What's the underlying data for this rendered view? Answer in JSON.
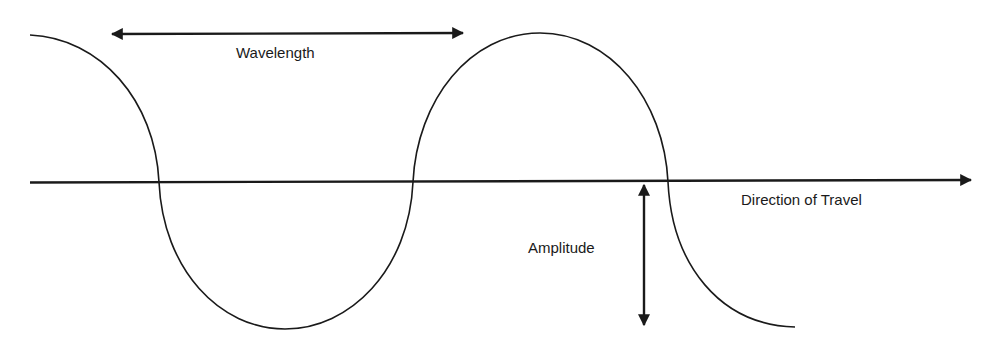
{
  "diagram": {
    "colors": {
      "stroke": "#1a1a1a",
      "background": "#ffffff"
    },
    "labels": {
      "wavelength": "Wavelength",
      "direction": "Direction of Travel",
      "amplitude": "Amplitude"
    },
    "elements": [
      {
        "id": "wave-curve",
        "type": "sine-curve",
        "start": [
          30,
          35
        ],
        "end": [
          795,
          327
        ],
        "crests_x": [
          30,
          540
        ],
        "troughs_x": [
          285,
          795
        ],
        "zero_crossings_x": [
          159,
          413,
          668
        ]
      },
      {
        "id": "axis",
        "type": "arrow",
        "from": [
          30,
          182
        ],
        "to": [
          973,
          180
        ],
        "label": "direction"
      },
      {
        "id": "wavelength-arrow",
        "type": "double-arrow",
        "from": [
          110,
          34
        ],
        "to": [
          465,
          33
        ],
        "label": "wavelength"
      },
      {
        "id": "amplitude-arrow",
        "type": "double-arrow",
        "from": [
          644,
          183
        ],
        "to": [
          644,
          327
        ],
        "label": "amplitude"
      }
    ]
  }
}
